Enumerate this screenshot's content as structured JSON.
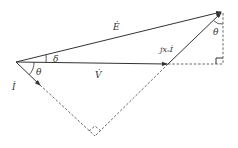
{
  "diagram": {
    "type": "phasor-diagram",
    "labels": {
      "E": "Ė",
      "V": "V̇",
      "I": "İ",
      "jxsI": "jxₛİ",
      "delta": "δ",
      "theta_origin": "θ",
      "theta_top": "θ"
    },
    "points": {
      "origin": [
        16,
        62
      ],
      "V_tip": [
        168,
        64
      ],
      "E_tip": [
        222,
        12
      ],
      "I_tip": [
        40,
        85
      ],
      "right_angle_bottom": [
        95,
        137
      ],
      "foot": [
        222,
        64
      ]
    },
    "colors": {
      "line": "#333333",
      "dash": "#555555",
      "background": "#ffffff"
    }
  }
}
